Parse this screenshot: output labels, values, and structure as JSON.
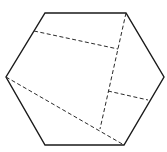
{
  "diagram": {
    "title": "",
    "shape": "hexagon",
    "stroke_color": "#1a1a1a",
    "dash_color": "#2a2a2a",
    "background": "#ffffff",
    "hexagon_vertices": [
      [
        45,
        13
      ],
      [
        126,
        13
      ],
      [
        164,
        77
      ],
      [
        124,
        145
      ],
      [
        45,
        145
      ],
      [
        6,
        77
      ]
    ],
    "dashed_segments": [
      {
        "name": "upper-fold-line",
        "from": [
          34,
          31
        ],
        "to": [
          118,
          49
        ]
      },
      {
        "name": "vertical-fold-line",
        "from": [
          126,
          13
        ],
        "to": [
          100,
          129
        ]
      },
      {
        "name": "lower-right-fold-line",
        "from": [
          108,
          91
        ],
        "to": [
          148,
          100
        ]
      },
      {
        "name": "diagonal-fold-line",
        "from": [
          6,
          77
        ],
        "to": [
          124,
          145
        ]
      }
    ]
  }
}
